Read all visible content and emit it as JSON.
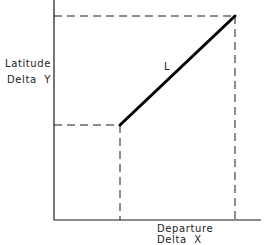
{
  "diagram": {
    "type": "latitude-departure",
    "y_axis_label": {
      "line1": "Latitude",
      "line2": "Delta  Y"
    },
    "x_axis_label": {
      "line1": "Departure",
      "line2": "Delta  X"
    },
    "line_label": "L",
    "colors": {
      "stroke": "#1a1a1a",
      "background": "#ffffff"
    }
  }
}
